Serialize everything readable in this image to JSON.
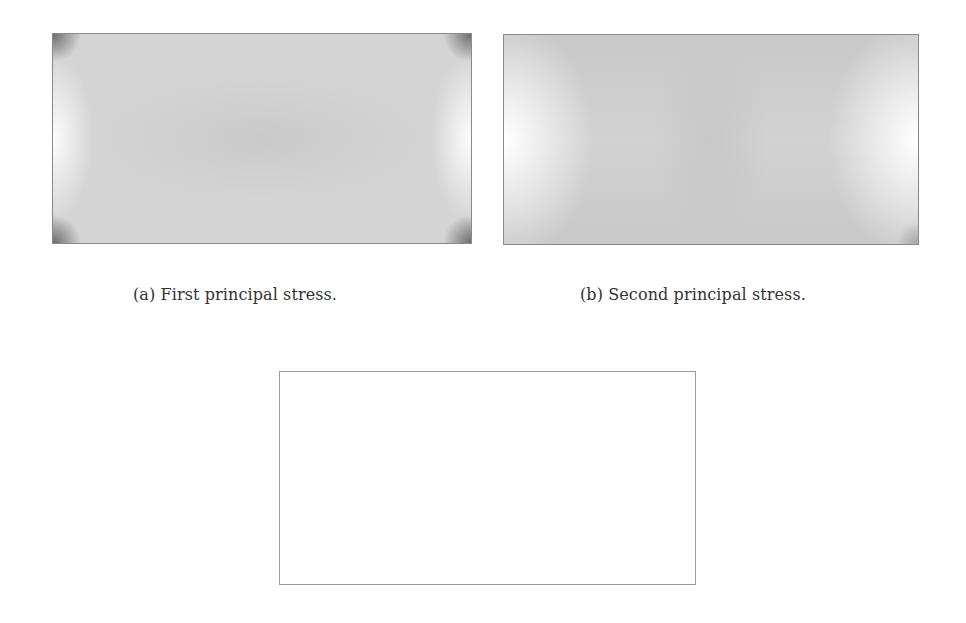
{
  "figure": {
    "panels": [
      {
        "id": "a",
        "caption": "(a) First principal stress.",
        "description": "grayscale stress field plot, near-uniform grey with lighter left/right edges and dark corners"
      },
      {
        "id": "b",
        "caption": "(b) Second principal stress.",
        "description": "grayscale stress field plot, grey center with white regions at left/right edges"
      },
      {
        "id": "c",
        "caption": "",
        "description": "blank white plot area"
      }
    ]
  }
}
